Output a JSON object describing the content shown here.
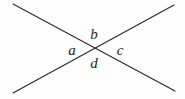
{
  "figure": {
    "kind": "intersecting-lines-angle-diagram",
    "background_color": "#fdfdfd",
    "stroke_color": "#2a2a2a",
    "stroke_width": 1.1,
    "width": 185,
    "height": 99,
    "intersection": {
      "x": 97,
      "y": 48
    },
    "lines": [
      {
        "name": "descending-line",
        "x1": 13,
        "y1": 4,
        "x2": 175,
        "y2": 91
      },
      {
        "name": "ascending-line",
        "x1": 13,
        "y1": 93,
        "x2": 174,
        "y2": 5
      }
    ],
    "labels": [
      {
        "id": "a",
        "text": "a",
        "position": "left-wedge",
        "x": 72,
        "y": 50
      },
      {
        "id": "b",
        "text": "b",
        "position": "top-wedge",
        "x": 94,
        "y": 34
      },
      {
        "id": "c",
        "text": "c",
        "position": "right-wedge",
        "x": 120,
        "y": 50
      },
      {
        "id": "d",
        "text": "d",
        "position": "bottom-wedge",
        "x": 94,
        "y": 63
      }
    ]
  }
}
